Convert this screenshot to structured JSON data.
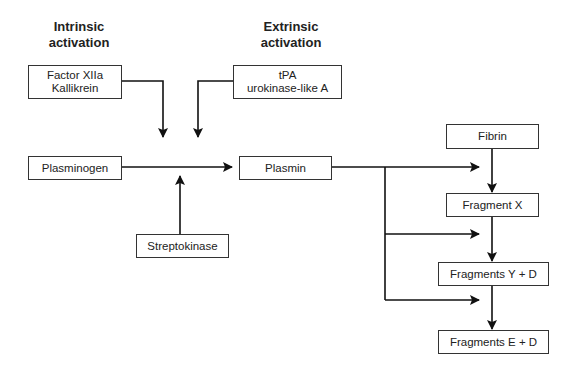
{
  "headings": {
    "intrinsic": [
      "Intrinsic",
      "activation"
    ],
    "extrinsic": [
      "Extrinsic",
      "activation"
    ]
  },
  "nodes": {
    "factor_xiia": [
      "Factor XIIa",
      "Kallikrein"
    ],
    "tpa": [
      "tPA",
      "urokinase-like A"
    ],
    "plasminogen": "Plasminogen",
    "plasmin": "Plasmin",
    "streptokinase": "Streptokinase",
    "fibrin": "Fibrin",
    "fragment_x": "Fragment X",
    "fragments_yd": "Fragments Y + D",
    "fragments_ed": "Fragments E + D"
  },
  "edges": [
    {
      "from": "Factor XIIa / Kallikrein",
      "to": "Plasminogen→Plasmin conversion"
    },
    {
      "from": "tPA / urokinase-like A",
      "to": "Plasminogen→Plasmin conversion"
    },
    {
      "from": "Streptokinase",
      "to": "Plasminogen→Plasmin conversion"
    },
    {
      "from": "Plasminogen",
      "to": "Plasmin"
    },
    {
      "from": "Plasmin",
      "to": "Fibrin→Fragment X"
    },
    {
      "from": "Plasmin",
      "to": "Fragment X→Fragments Y + D"
    },
    {
      "from": "Plasmin",
      "to": "Fragments Y + D→Fragments E + D"
    },
    {
      "from": "Fibrin",
      "to": "Fragment X"
    },
    {
      "from": "Fragment X",
      "to": "Fragments Y + D"
    },
    {
      "from": "Fragments Y + D",
      "to": "Fragments E + D"
    }
  ],
  "colors": {
    "line": "#111111",
    "box_border": "#333333",
    "background": "#ffffff"
  }
}
